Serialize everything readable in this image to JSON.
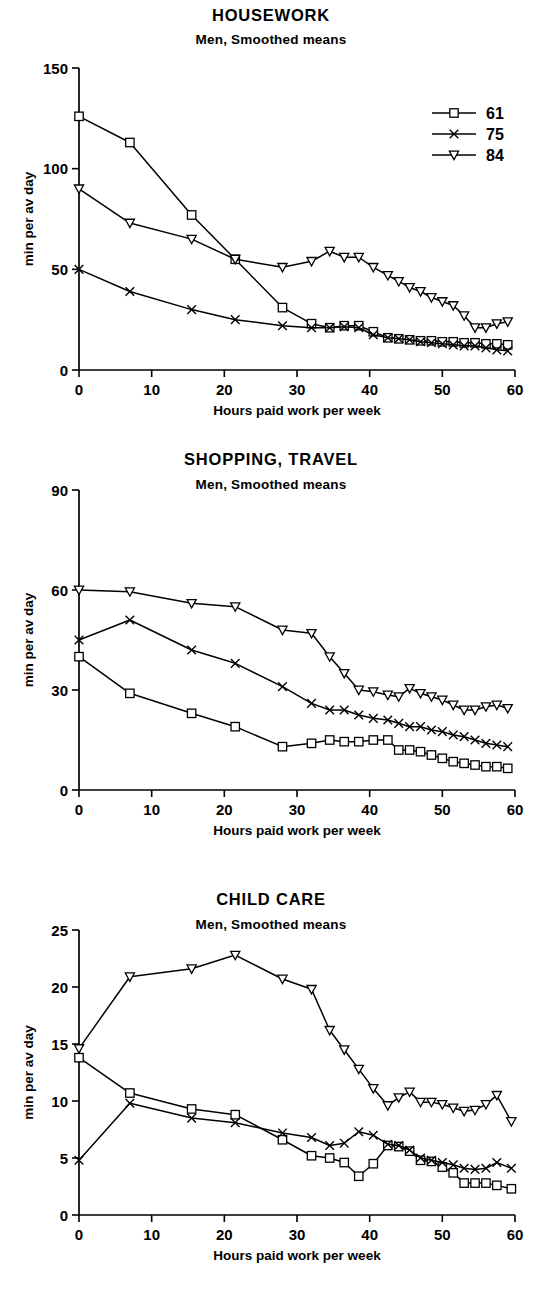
{
  "figure": {
    "axis_x_label": "Hours paid work per week",
    "axis_y_label": "min per av day",
    "subtitle": "Men,  Smoothed means",
    "legend": {
      "items": [
        {
          "label": "61",
          "marker": "square-marker"
        },
        {
          "label": "75",
          "marker": "x-marker"
        },
        {
          "label": "84",
          "marker": "triangle-down-marker"
        }
      ]
    },
    "ink_color": "#000000",
    "background_color": "#ffffff"
  },
  "panels": {
    "housework": {
      "title": "HOUSEWORK",
      "subtitle": "Men,  Smoothed means",
      "xlabel": "Hours paid work per week",
      "ylabel": "min per av day",
      "xticks": [
        "0",
        "10",
        "20",
        "30",
        "40",
        "50",
        "60"
      ],
      "yticks": [
        "0",
        "50",
        "100",
        "150"
      ]
    },
    "shopping": {
      "title": "SHOPPING, TRAVEL",
      "subtitle": "Men,  Smoothed means",
      "xlabel": "Hours paid work per week",
      "ylabel": "min per av day",
      "xticks": [
        "0",
        "10",
        "20",
        "30",
        "40",
        "50",
        "60"
      ],
      "yticks": [
        "0",
        "30",
        "60",
        "90"
      ]
    },
    "childcare": {
      "title": "CHILD CARE",
      "subtitle": "Men,  Smoothed means",
      "xlabel": "Hours paid work per week",
      "ylabel": "min per av day",
      "xticks": [
        "0",
        "10",
        "20",
        "30",
        "40",
        "50",
        "60"
      ],
      "yticks": [
        "0",
        "5",
        "10",
        "15",
        "20",
        "25"
      ]
    }
  },
  "chart_data": [
    {
      "id": "housework",
      "type": "line",
      "title": "HOUSEWORK",
      "subtitle": "Men,  Smoothed means",
      "xlabel": "Hours paid work per week",
      "ylabel": "min per av day",
      "xlim": [
        0,
        60
      ],
      "ylim": [
        0,
        150
      ],
      "xticks": [
        0,
        10,
        20,
        30,
        40,
        50,
        60
      ],
      "yticks": [
        0,
        50,
        100,
        150
      ],
      "grid": false,
      "legend_position": "top-right",
      "series": [
        {
          "name": "61",
          "marker": "square",
          "x": [
            0,
            7,
            15.5,
            21.5,
            28,
            32,
            34.5,
            36.5,
            38.5,
            40.5,
            42.5,
            44,
            45.5,
            47,
            48.5,
            50,
            51.5,
            53,
            54.5,
            56,
            57.5,
            59
          ],
          "y": [
            126,
            113,
            77,
            55,
            31,
            23,
            21,
            22,
            22,
            19,
            16,
            15.5,
            15,
            14.5,
            14.5,
            14,
            14,
            13.5,
            13.5,
            13,
            13,
            12.5
          ]
        },
        {
          "name": "75",
          "marker": "x",
          "x": [
            0,
            7,
            15.5,
            21.5,
            28,
            32,
            34.5,
            36.5,
            38.5,
            40.5,
            42.5,
            44,
            45.5,
            47,
            48.5,
            50,
            51.5,
            53,
            54.5,
            56,
            57.5,
            59
          ],
          "y": [
            50,
            39,
            30,
            25,
            22,
            21,
            21,
            21.5,
            21,
            17.5,
            16,
            15.5,
            15,
            14,
            13.5,
            13,
            12.5,
            12,
            12,
            11,
            10,
            9.5
          ]
        },
        {
          "name": "84",
          "marker": "triangle-down",
          "x": [
            0,
            7,
            15.5,
            21.5,
            28,
            32,
            34.5,
            36.5,
            38.5,
            40.5,
            42.5,
            44,
            45.5,
            47,
            48.5,
            50,
            51.5,
            53,
            54.5,
            56,
            57.5,
            59
          ],
          "y": [
            90,
            73,
            65,
            55,
            51,
            54,
            59,
            56,
            56,
            51,
            47,
            44,
            41,
            39,
            36,
            34,
            32,
            27,
            21,
            21,
            23,
            24
          ]
        }
      ]
    },
    {
      "id": "shopping",
      "type": "line",
      "title": "SHOPPING, TRAVEL",
      "subtitle": "Men,  Smoothed means",
      "xlabel": "Hours paid work per week",
      "ylabel": "min per av day",
      "xlim": [
        0,
        60
      ],
      "ylim": [
        0,
        90
      ],
      "xticks": [
        0,
        10,
        20,
        30,
        40,
        50,
        60
      ],
      "yticks": [
        0,
        30,
        60,
        90
      ],
      "grid": false,
      "legend_position": "none",
      "series": [
        {
          "name": "61",
          "marker": "square",
          "x": [
            0,
            7,
            15.5,
            21.5,
            28,
            32,
            34.5,
            36.5,
            38.5,
            40.5,
            42.5,
            44,
            45.5,
            47,
            48.5,
            50,
            51.5,
            53,
            54.5,
            56,
            57.5,
            59
          ],
          "y": [
            40,
            29,
            23,
            19,
            13,
            14,
            15,
            14.5,
            14.5,
            15,
            15,
            12,
            12,
            11.5,
            10.5,
            9.5,
            8.5,
            8,
            7.5,
            7,
            7,
            6.5
          ]
        },
        {
          "name": "75",
          "marker": "x",
          "x": [
            0,
            7,
            15.5,
            21.5,
            28,
            32,
            34.5,
            36.5,
            38.5,
            40.5,
            42.5,
            44,
            45.5,
            47,
            48.5,
            50,
            51.5,
            53,
            54.5,
            56,
            57.5,
            59
          ],
          "y": [
            45,
            51,
            42,
            38,
            31,
            26,
            24,
            24,
            22.5,
            21.5,
            21,
            20,
            19,
            19,
            18,
            17.5,
            16.5,
            16,
            15,
            14,
            13.5,
            13
          ]
        },
        {
          "name": "84",
          "marker": "triangle-down",
          "x": [
            0,
            7,
            15.5,
            21.5,
            28,
            32,
            34.5,
            36.5,
            38.5,
            40.5,
            42.5,
            44,
            45.5,
            47,
            48.5,
            50,
            51.5,
            53,
            54.5,
            56,
            57.5,
            59
          ],
          "y": [
            60,
            59.5,
            56,
            55,
            48,
            47,
            40,
            35,
            30,
            29.5,
            28.5,
            28,
            30.5,
            29,
            28,
            27,
            25.5,
            24,
            24,
            25,
            25.5,
            24.5
          ]
        }
      ]
    },
    {
      "id": "childcare",
      "type": "line",
      "title": "CHILD CARE",
      "subtitle": "Men,  Smoothed means",
      "xlabel": "Hours paid work per week",
      "ylabel": "min per av day",
      "xlim": [
        0,
        60
      ],
      "ylim": [
        0,
        25
      ],
      "xticks": [
        0,
        10,
        20,
        30,
        40,
        50,
        60
      ],
      "yticks": [
        0,
        5,
        10,
        15,
        20,
        25
      ],
      "grid": false,
      "legend_position": "none",
      "series": [
        {
          "name": "61",
          "marker": "square",
          "x": [
            0,
            7,
            15.5,
            21.5,
            28,
            32,
            34.5,
            36.5,
            38.5,
            40.5,
            42.5,
            44,
            45.5,
            47,
            48.5,
            50,
            51.5,
            53,
            54.5,
            56,
            57.5,
            59.5
          ],
          "y": [
            13.8,
            10.7,
            9.3,
            8.8,
            6.6,
            5.2,
            5.0,
            4.6,
            3.4,
            4.5,
            6.1,
            6.0,
            5.6,
            4.8,
            4.7,
            4.2,
            3.7,
            2.8,
            2.8,
            2.8,
            2.6,
            2.3
          ]
        },
        {
          "name": "75",
          "marker": "x",
          "x": [
            0,
            7,
            15.5,
            21.5,
            28,
            32,
            34.5,
            36.5,
            38.5,
            40.5,
            42.5,
            44,
            45.5,
            47,
            48.5,
            50,
            51.5,
            53,
            54.5,
            56,
            57.5,
            59.5
          ],
          "y": [
            4.8,
            9.8,
            8.5,
            8.1,
            7.2,
            6.8,
            6.1,
            6.3,
            7.3,
            7.0,
            6.2,
            6.1,
            5.7,
            5.0,
            4.8,
            4.6,
            4.4,
            4.1,
            4.0,
            4.1,
            4.6,
            4.1
          ]
        },
        {
          "name": "84",
          "marker": "triangle-down",
          "x": [
            0,
            7,
            15.5,
            21.5,
            28,
            32,
            34.5,
            36.5,
            38.5,
            40.5,
            42.5,
            44,
            45.5,
            47,
            48.5,
            50,
            51.5,
            53,
            54.5,
            56,
            57.5,
            59.5
          ],
          "y": [
            14.6,
            20.9,
            21.6,
            22.8,
            20.7,
            19.8,
            16.2,
            14.5,
            12.8,
            11.1,
            9.6,
            10.3,
            10.8,
            9.9,
            9.9,
            9.7,
            9.4,
            9.1,
            9.2,
            9.7,
            10.5,
            8.2
          ]
        }
      ]
    }
  ]
}
